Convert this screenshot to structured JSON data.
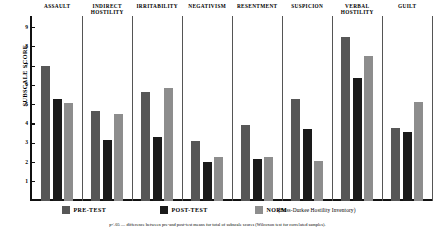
{
  "chart_data": {
    "type": "bar",
    "title": "",
    "xlabel": "",
    "ylabel": "SUBSCALE SCORE",
    "ylim": [
      0,
      9.6
    ],
    "yticks": [
      1,
      2,
      3,
      4,
      5,
      6,
      7,
      8,
      9
    ],
    "ytick_labels": [
      "1",
      "2",
      "3",
      "4",
      "5",
      "6",
      "7",
      "8",
      "9"
    ],
    "grid": false,
    "legend_position": "bottom",
    "categories": [
      "ASSAULT",
      "INDIRECT\nHOSTILITY",
      "IRRITABILITY",
      "NEGATIVISM",
      "RESENTMENT",
      "SUSPICION",
      "VERBAL\nHOSTILITY",
      "GUILT"
    ],
    "series": [
      {
        "name": "PRE-TEST",
        "color": "#575757",
        "values": [
          7.0,
          4.65,
          5.65,
          3.1,
          3.95,
          5.3,
          8.5,
          3.8
        ]
      },
      {
        "name": "POST-TEST",
        "color": "#1a1a1a",
        "values": [
          5.3,
          3.15,
          3.3,
          2.0,
          2.2,
          3.75,
          6.4,
          3.6
        ]
      },
      {
        "name": "NORM",
        "color": "#8d8d8d",
        "values": [
          5.1,
          4.5,
          5.85,
          2.3,
          2.3,
          2.1,
          7.5,
          5.15
        ]
      }
    ],
    "source_note": "(Buss-Durkee Hostility Inventory)",
    "footnote": "p<.05 — difference between pre-and post-test means for total of subscale scores  (Wilcoxon test for correlated samples)."
  }
}
